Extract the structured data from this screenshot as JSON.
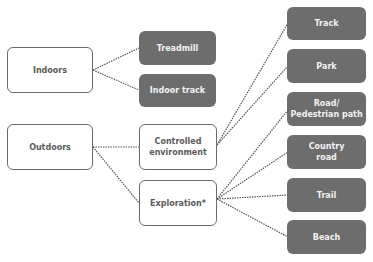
{
  "diagram": {
    "colors": {
      "outline_border": "#6a6a6a",
      "outline_text": "#5a5a5a",
      "filled_bg": "#6d6d6d",
      "filled_text": "#f2f2f2",
      "connector": "#555555"
    },
    "nodes": [
      {
        "id": "indoors",
        "label": "Indoors",
        "style": "outline",
        "x": 7,
        "y": 47,
        "w": 86,
        "h": 46
      },
      {
        "id": "outdoors",
        "label": "Outdoors",
        "style": "outline",
        "x": 7,
        "y": 124,
        "w": 86,
        "h": 46
      },
      {
        "id": "treadmill",
        "label": "Treadmill",
        "style": "filled",
        "x": 139,
        "y": 31,
        "w": 77,
        "h": 34
      },
      {
        "id": "indoor-track",
        "label": "Indoor track",
        "style": "filled",
        "x": 139,
        "y": 74,
        "w": 77,
        "h": 33
      },
      {
        "id": "controlled-environment",
        "label": "Controlled\nenvironment",
        "style": "outline",
        "x": 139,
        "y": 124,
        "w": 78,
        "h": 46
      },
      {
        "id": "exploration",
        "label": "Exploration*",
        "style": "outline",
        "x": 139,
        "y": 180,
        "w": 78,
        "h": 46
      },
      {
        "id": "track",
        "label": "Track",
        "style": "filled",
        "x": 287,
        "y": 7,
        "w": 79,
        "h": 33
      },
      {
        "id": "park",
        "label": "Park",
        "style": "filled",
        "x": 287,
        "y": 49,
        "w": 79,
        "h": 34
      },
      {
        "id": "road",
        "label": "Road/\nPedestrian path",
        "style": "filled",
        "x": 287,
        "y": 92,
        "w": 79,
        "h": 34
      },
      {
        "id": "country-road",
        "label": "Country\nroad",
        "style": "filled",
        "x": 287,
        "y": 135,
        "w": 79,
        "h": 34
      },
      {
        "id": "trail",
        "label": "Trail",
        "style": "filled",
        "x": 287,
        "y": 178,
        "w": 79,
        "h": 34
      },
      {
        "id": "beach",
        "label": "Beach",
        "style": "filled",
        "x": 287,
        "y": 220,
        "w": 79,
        "h": 34
      }
    ],
    "edges": [
      {
        "from": "indoors",
        "to": "treadmill",
        "x1": 93,
        "y1": 70,
        "x2": 139,
        "y2": 48
      },
      {
        "from": "indoors",
        "to": "indoor-track",
        "x1": 93,
        "y1": 70,
        "x2": 139,
        "y2": 90
      },
      {
        "from": "outdoors",
        "to": "controlled-environment",
        "x1": 93,
        "y1": 147,
        "x2": 139,
        "y2": 147
      },
      {
        "from": "outdoors",
        "to": "exploration",
        "x1": 93,
        "y1": 147,
        "x2": 139,
        "y2": 203
      },
      {
        "from": "controlled-environment",
        "to": "track",
        "x1": 217,
        "y1": 145,
        "x2": 288,
        "y2": 23
      },
      {
        "from": "controlled-environment",
        "to": "park",
        "x1": 217,
        "y1": 145,
        "x2": 288,
        "y2": 66
      },
      {
        "from": "exploration",
        "to": "road",
        "x1": 217,
        "y1": 199,
        "x2": 288,
        "y2": 110
      },
      {
        "from": "exploration",
        "to": "country-road",
        "x1": 217,
        "y1": 199,
        "x2": 288,
        "y2": 152
      },
      {
        "from": "exploration",
        "to": "trail",
        "x1": 217,
        "y1": 199,
        "x2": 288,
        "y2": 195
      },
      {
        "from": "exploration",
        "to": "beach",
        "x1": 217,
        "y1": 199,
        "x2": 288,
        "y2": 237
      }
    ],
    "caption": ""
  }
}
